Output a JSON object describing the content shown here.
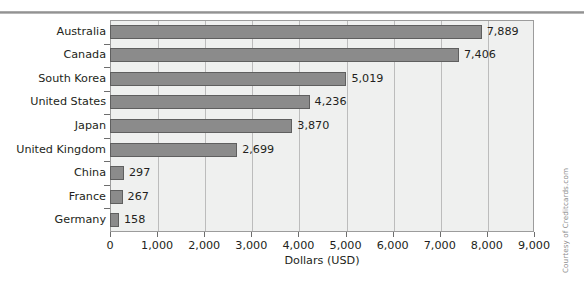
{
  "credit": "Courtesy of Creditcards.com",
  "chart_data": {
    "type": "bar",
    "orientation": "horizontal",
    "title": "",
    "xlabel": "Dollars (USD)",
    "ylabel": "",
    "xlim": [
      0,
      9000
    ],
    "grid": true,
    "legend": false,
    "categories": [
      "Australia",
      "Canada",
      "South Korea",
      "United States",
      "Japan",
      "United Kingdom",
      "China",
      "France",
      "Germany"
    ],
    "values": [
      7889,
      7406,
      5019,
      4236,
      3870,
      2699,
      297,
      267,
      158
    ],
    "value_labels": [
      "7,889",
      "7,406",
      "5,019",
      "4,236",
      "3,870",
      "2,699",
      "297",
      "267",
      "158"
    ],
    "xticks": [
      0,
      1000,
      2000,
      3000,
      4000,
      5000,
      6000,
      7000,
      8000,
      9000
    ],
    "xtick_labels": [
      "0",
      "1,000",
      "2,000",
      "3,000",
      "4,000",
      "5,000",
      "6,000",
      "7,000",
      "8,000",
      "9,000"
    ],
    "colors": {
      "bar_fill": "#8b8b8b",
      "bar_border": "#5f5f5f",
      "plot_background": "#eff0ef",
      "gridline": "#bcbcbc",
      "axis": "#9c9c9c",
      "text": "#231f20"
    }
  }
}
